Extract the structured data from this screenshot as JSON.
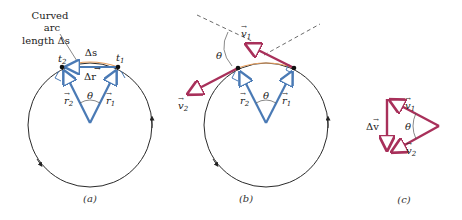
{
  "colors": {
    "circle": "#2a2a2a",
    "radius_vector": "#4a7ab5",
    "velocity_vector": "#a8305a",
    "arc": "#e8a060",
    "dashed": "#444444"
  },
  "panels": {
    "a": {
      "caption": "(a)",
      "annotation_line1": "Curved",
      "annotation_line2": "arc",
      "annotation_line3": "length Δs",
      "arc_label": "Δs",
      "chord_label": "Δr",
      "t1": "t",
      "t1_sub": "1",
      "t2": "t",
      "t2_sub": "2",
      "r1": "r",
      "r1_sub": "1",
      "r2": "r",
      "r2_sub": "2",
      "angle": "θ"
    },
    "b": {
      "caption": "(b)",
      "v1": "v",
      "v1_sub": "1",
      "v2": "v",
      "v2_sub": "2",
      "r1": "r",
      "r1_sub": "1",
      "r2": "r",
      "r2_sub": "2",
      "angle": "θ",
      "angle_outer": "θ"
    },
    "c": {
      "caption": "(c)",
      "v1": "v",
      "v1_sub": "1",
      "v2": "v",
      "v2_sub": "2",
      "dv": "Δv",
      "angle": "θ"
    }
  }
}
